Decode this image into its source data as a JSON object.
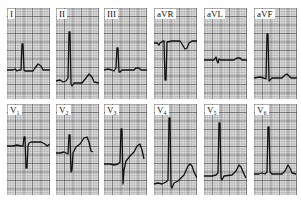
{
  "figure": {
    "type": "12-lead electrocardiogram",
    "rows": [
      {
        "leads": [
          {
            "label": "I",
            "trace": "M0,62 L6,62 L8,61 L10,63 L12,62 L14,62 L15,36 L16,36 L17,62 L18,63 L26,63 L28,60 L31,56 L34,58 L36,62 L43,62"
          },
          {
            "label": "II",
            "trace": "M0,73 L4,72 L7,74 L10,73 L12,70 L13,24 L14,24 L15,76 L16,78 L18,75 L26,75 L30,70 L33,66 L36,69 L38,74 L43,75"
          },
          {
            "label": "III",
            "trace": "M0,62 L4,61 L8,62 L10,63 L12,60 L13,40 L14,40 L15,64 L16,64 L18,62 L30,62 L32,60 L35,60 L37,62 L43,62"
          },
          {
            "label": "aVR",
            "trace": "M0,35 L3,35 L5,37 L6,35 L9,33 L10,33 L11,72 L12,72 L13,34 L18,33 L26,33 L28,36 L31,41 L33,40 L35,35 L38,33 L43,33"
          },
          {
            "label": "aVL",
            "trace": "M0,52 L10,52 L12,49 L13,53 L14,55 L15,51 L17,52 L30,52 L33,50 L36,50 L38,52 L43,52"
          },
          {
            "label": "aVF",
            "trace": "M0,70 L6,69 L10,70 L12,71 L13,26 L14,26 L15,73 L16,72 L18,70 L28,70 L31,67 L33,66 L35,68 L37,70 L43,70"
          }
        ]
      },
      {
        "leads": [
          {
            "label": "V₁",
            "trace": "M0,42 L6,42 L10,41 L14,42 L16,42 L17,33 L18,33 L19,64 L20,64 L21,42 L22,39 L24,38 L34,38 L38,40 L40,42 L43,40"
          },
          {
            "label": "V₂",
            "trace": "M0,49 L4,49 L8,48 L10,49 L12,50 L13,31 L14,31 L15,68 L16,66 L17,49 L20,43 L24,40 L28,34 L31,33 L33,38 L35,47 L37,48"
          },
          {
            "label": "V₃",
            "trace": "M0,60 L6,60 L10,61 L14,60 L16,58 L17,25 L18,25 L19,80 L20,66 L22,57 L26,52 L30,48 L33,42 L36,40 L38,46 L40,55"
          },
          {
            "label": "V₄",
            "trace": "M0,80 L4,79 L8,80 L12,78 L14,76 L15,14 L16,14 L17,82 L18,84 L20,79 L24,77 L30,71 L34,62 L36,60 L38,62 L40,68 L43,74"
          },
          {
            "label": "V₅",
            "trace": "M0,72 L4,72 L8,72 L12,71 L14,69 L15,19 L16,19 L17,74 L18,76 L20,72 L28,71 L32,67 L35,61 L37,63 L39,68 L42,74"
          },
          {
            "label": "V₆",
            "trace": "M0,70 L5,70 L8,69 L11,70 L13,68 L14,23 L15,23 L16,68 L18,70 L28,70 L31,67 L34,61 L36,64 L38,69 L42,70"
          }
        ]
      }
    ],
    "colors": {
      "grid_major": "#4a4a4a",
      "grid_minor": "#8a8a8a",
      "trace": "#111111",
      "label_bg": "#ffffff"
    }
  }
}
